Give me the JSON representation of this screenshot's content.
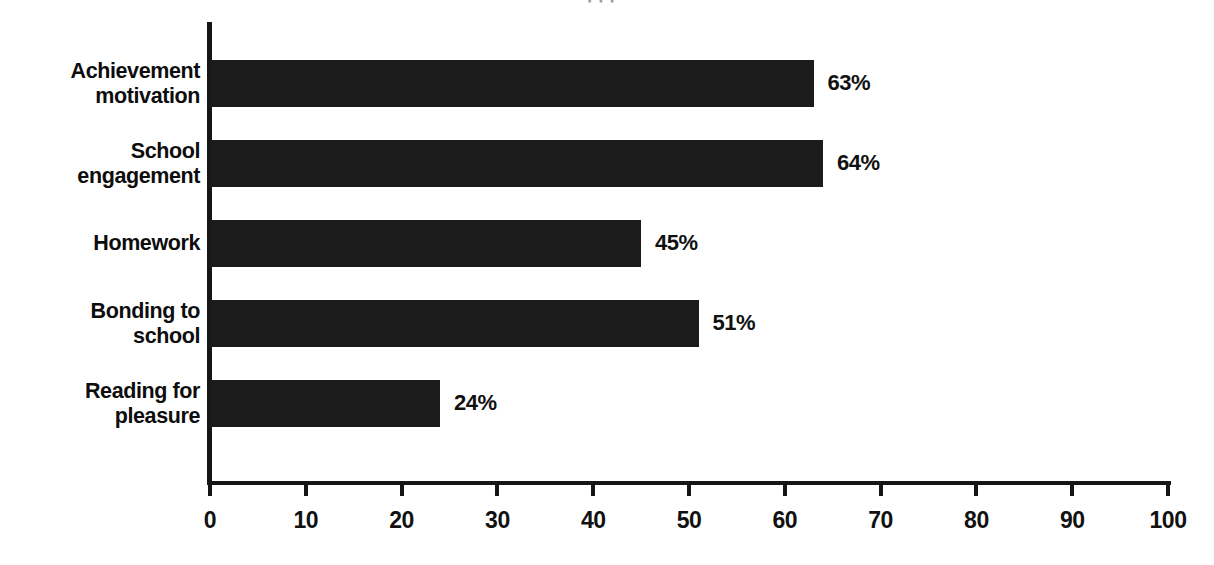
{
  "chart_data": {
    "type": "bar",
    "orientation": "horizontal",
    "title": "",
    "xlabel": "",
    "ylabel": "",
    "xlim": [
      0,
      100
    ],
    "grid": false,
    "legend": null,
    "value_suffix": "%",
    "categories": [
      "Achievement\nmotivation",
      "School\nengagement",
      "Homework",
      "Bonding to\nschool",
      "Reading for\npleasure"
    ],
    "values": [
      63,
      64,
      45,
      51,
      24
    ],
    "value_labels": [
      "63%",
      "64%",
      "45%",
      "51%",
      "24%"
    ],
    "xticks": [
      0,
      10,
      20,
      30,
      40,
      50,
      60,
      70,
      80,
      90,
      100
    ],
    "xtick_labels": [
      "0",
      "10",
      "20",
      "30",
      "40",
      "50",
      "60",
      "70",
      "80",
      "90",
      "100"
    ],
    "bar_color": "#1b1b1b",
    "axis_color": "#161616",
    "text_color": "#111111",
    "background": "#ffffff"
  },
  "partial_title": "' ' ' ,"
}
